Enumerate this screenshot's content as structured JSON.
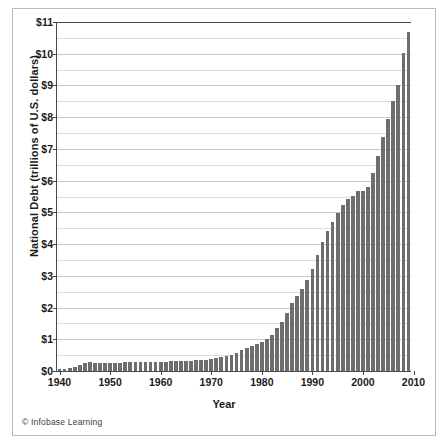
{
  "chart_data": {
    "type": "bar",
    "title": "",
    "xlabel": "Year",
    "ylabel": "National Debt (trillions of U.S. dollars)",
    "ylim": [
      0,
      11
    ],
    "xlim": [
      1939.5,
      2009.5
    ],
    "grid": true,
    "legend": null,
    "y_major_step": 1,
    "y_minor_step": 0.5,
    "bar_color": "#6e6e6e",
    "ytick_labels": [
      "$0",
      "$1",
      "$2",
      "$3",
      "$4",
      "$5",
      "$6",
      "$7",
      "$8",
      "$9",
      "$10",
      "$11"
    ],
    "ytick_values": [
      0,
      1,
      2,
      3,
      4,
      5,
      6,
      7,
      8,
      9,
      10,
      11
    ],
    "xtick_labels": [
      "1940",
      "1950",
      "1960",
      "1970",
      "1980",
      "1990",
      "2000",
      "2010"
    ],
    "xtick_values": [
      1940,
      1950,
      1960,
      1970,
      1980,
      1990,
      2000,
      2010
    ],
    "categories": [
      1940,
      1941,
      1942,
      1943,
      1944,
      1945,
      1946,
      1947,
      1948,
      1949,
      1950,
      1951,
      1952,
      1953,
      1954,
      1955,
      1956,
      1957,
      1958,
      1959,
      1960,
      1961,
      1962,
      1963,
      1964,
      1965,
      1966,
      1967,
      1968,
      1969,
      1970,
      1971,
      1972,
      1973,
      1974,
      1975,
      1976,
      1977,
      1978,
      1979,
      1980,
      1981,
      1982,
      1983,
      1984,
      1985,
      1986,
      1987,
      1988,
      1989,
      1990,
      1991,
      1992,
      1993,
      1994,
      1995,
      1996,
      1997,
      1998,
      1999,
      2000,
      2001,
      2002,
      2003,
      2004,
      2005,
      2006,
      2007,
      2008,
      2009
    ],
    "values": [
      0.05,
      0.06,
      0.08,
      0.14,
      0.2,
      0.26,
      0.27,
      0.26,
      0.25,
      0.25,
      0.26,
      0.26,
      0.26,
      0.27,
      0.27,
      0.27,
      0.27,
      0.27,
      0.28,
      0.29,
      0.29,
      0.29,
      0.3,
      0.31,
      0.32,
      0.32,
      0.33,
      0.34,
      0.35,
      0.35,
      0.37,
      0.41,
      0.44,
      0.47,
      0.49,
      0.58,
      0.65,
      0.72,
      0.79,
      0.85,
      0.91,
      1.0,
      1.14,
      1.37,
      1.56,
      1.82,
      2.13,
      2.35,
      2.6,
      2.87,
      3.23,
      3.67,
      4.06,
      4.41,
      4.69,
      4.97,
      5.22,
      5.41,
      5.53,
      5.66,
      5.67,
      5.81,
      6.23,
      6.78,
      7.38,
      7.93,
      8.51,
      9.01,
      10.02,
      10.7
    ],
    "annotations": {
      "credit": "© Infobase Learning"
    }
  }
}
